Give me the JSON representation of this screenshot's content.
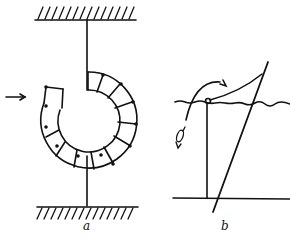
{
  "figure": {
    "labels": {
      "a": "a",
      "b": "b"
    },
    "colors": {
      "ink": "#111111",
      "background": "#ffffff"
    },
    "panel_a": {
      "description": "Spiral spring fixed between two hatched supports, with horizontal arrow indicating applied force",
      "spiral_segments": 12
    },
    "panel_b": {
      "description": "Fishing rod over water line with pivot, fish, and curved arrow"
    }
  }
}
